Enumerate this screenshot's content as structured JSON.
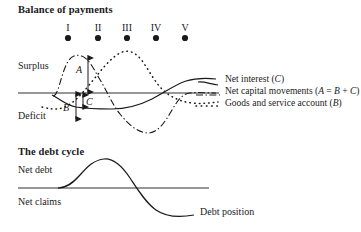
{
  "figure": {
    "panels": [
      {
        "id": "balance-of-payments",
        "title": "Balance of payments",
        "axis_top_label": "Surplus",
        "axis_bottom_label": "Deficit"
      },
      {
        "id": "debt-cycle",
        "title": "The debt cycle",
        "axis_top_label": "Net debt",
        "axis_bottom_label": "Net claims",
        "curve_label": "Debt position"
      }
    ]
  },
  "phases": [
    {
      "numeral": "I",
      "x": 68
    },
    {
      "numeral": "II",
      "x": 98
    },
    {
      "numeral": "III",
      "x": 127
    },
    {
      "numeral": "IV",
      "x": 156
    },
    {
      "numeral": "V",
      "x": 185
    }
  ],
  "legend": {
    "position": "right",
    "entries": [
      {
        "text": "Net interest (C)",
        "style": "solid",
        "series": "C"
      },
      {
        "text": "Net capital movements (A = B + C)",
        "style": "dash-dot",
        "series": "A"
      },
      {
        "text": "Goods and service account (B)",
        "style": "dotted",
        "series": "B"
      }
    ]
  },
  "annotations": [
    {
      "label": "A",
      "type": "double-arrow",
      "note": "amplitude of net capital movements above axis"
    },
    {
      "label": "B",
      "type": "double-arrow",
      "note": "goods and service account below axis"
    },
    {
      "label": "C",
      "type": "double-arrow",
      "note": "net interest below axis"
    }
  ],
  "colors": {
    "ink": "#1a1a1a",
    "axis": "#333333",
    "background": "#ffffff"
  },
  "chart_data": {
    "type": "line",
    "title": "Balance of payments",
    "xlabel": "",
    "ylabel": "",
    "grid": false,
    "legend_position": "right",
    "axis_labels": {
      "above": "Surplus",
      "below": "Deficit"
    },
    "x_tick_labels": [
      "I",
      "II",
      "III",
      "IV",
      "V"
    ],
    "x": [
      0,
      1,
      2,
      3,
      4
    ],
    "series": [
      {
        "name": "Net capital movements (A = B + C)",
        "symbol": "A",
        "style": "dash-dot",
        "values": [
          0,
          1.0,
          0.0,
          -0.85,
          0.05
        ],
        "note": "peaks in surplus around phase I-II, troughs in deficit around phase IV"
      },
      {
        "name": "Goods and service account (B)",
        "symbol": "B",
        "style": "dotted",
        "values": [
          -0.45,
          0.1,
          1.05,
          0.05,
          -0.35
        ],
        "note": "starts in deficit, peaks in surplus at phase III, returns to deficit"
      },
      {
        "name": "Net interest (C)",
        "symbol": "C",
        "style": "solid",
        "values": [
          -0.12,
          -0.4,
          -0.42,
          0.0,
          0.4
        ],
        "note": "shallow deficit early, crosses into surplus near phase IV and levels off"
      }
    ],
    "secondary_chart": {
      "type": "line",
      "title": "The debt cycle",
      "axis_labels": {
        "above": "Net debt",
        "below": "Net claims"
      },
      "series": [
        {
          "name": "Debt position",
          "style": "solid",
          "x": [
            0,
            1,
            2,
            3,
            4
          ],
          "values": [
            0.0,
            0.35,
            0.95,
            0.1,
            -1.0
          ],
          "note": "rises into net debt, peaks, then falls through axis into net claims"
        }
      ]
    }
  }
}
